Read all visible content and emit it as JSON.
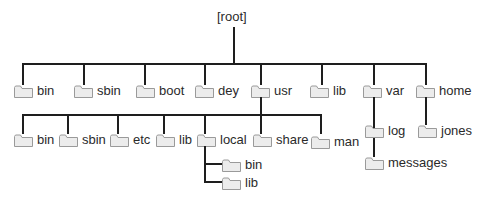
{
  "diagram": {
    "type": "directory-tree",
    "root": {
      "label": "[root]"
    },
    "level1": [
      {
        "label": "bin"
      },
      {
        "label": "sbin"
      },
      {
        "label": "boot"
      },
      {
        "label": "dey"
      },
      {
        "label": "usr"
      },
      {
        "label": "lib"
      },
      {
        "label": "var"
      },
      {
        "label": "home"
      }
    ],
    "usr_children": [
      {
        "label": "bin"
      },
      {
        "label": "sbin"
      },
      {
        "label": "etc"
      },
      {
        "label": "lib"
      },
      {
        "label": "local"
      },
      {
        "label": "share"
      },
      {
        "label": "man"
      }
    ],
    "local_children": [
      {
        "label": "bin"
      },
      {
        "label": "lib"
      }
    ],
    "var_children": [
      {
        "label": "log"
      },
      {
        "label": "messages"
      }
    ],
    "home_children": [
      {
        "label": "jones"
      }
    ],
    "colors": {
      "line": "#1e1e1e",
      "folder_fill": "#ececec",
      "folder_stroke": "#9a9a9a",
      "text": "#2a2a2a"
    }
  }
}
